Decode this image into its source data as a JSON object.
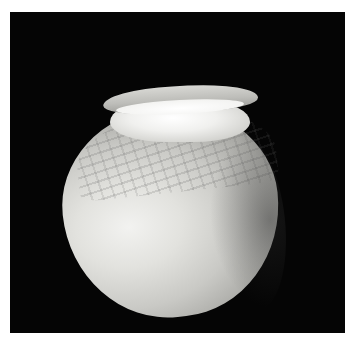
{
  "image": {
    "subject": "ceramic pot",
    "description": "Round-bodied clay pot with a short flared rim, textured upper body, photographed against a black background",
    "background_color": "#050505",
    "border_color": "#ffffff"
  }
}
